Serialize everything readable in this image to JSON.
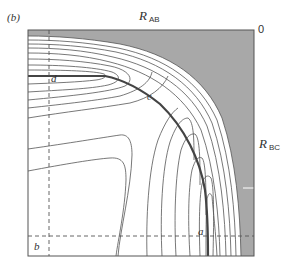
{
  "figure": {
    "panel_label": "(b)",
    "x_axis": {
      "symbol": "R",
      "subscript": "AB"
    },
    "y_axis": {
      "symbol": "R",
      "subscript": "BC"
    },
    "origin_label": "0",
    "points": {
      "a": "a",
      "b": "b",
      "c": "c",
      "d": "d"
    },
    "colors": {
      "shaded_region": "#a8a8a8",
      "contour": "#555555",
      "reaction_path": "#444444",
      "frame": "#555555",
      "dashed": "#555555"
    }
  }
}
